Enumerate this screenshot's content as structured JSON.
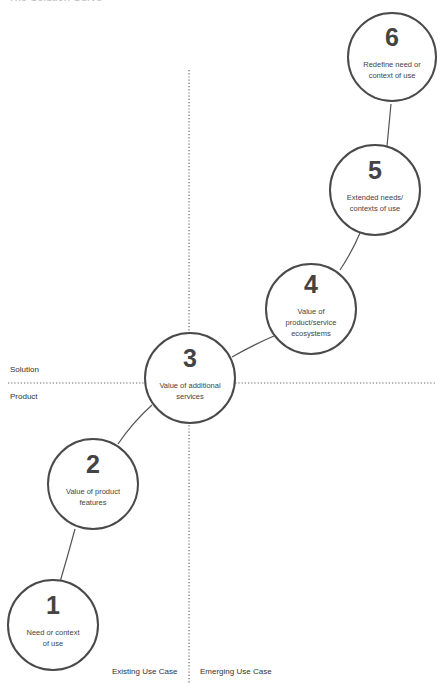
{
  "title": "The Solution Curve",
  "axes": {
    "horizontal_upper_label": "Solution",
    "horizontal_lower_label": "Product",
    "vertical_left_label": "Existing Use Case",
    "vertical_right_label": "Emerging Use Case"
  },
  "nodes": [
    {
      "number": "1",
      "label": "Need or context of use"
    },
    {
      "number": "2",
      "label": "Value of product features"
    },
    {
      "number": "3",
      "label": "Value of additional services"
    },
    {
      "number": "4",
      "label": "Value of product/service ecosystems"
    },
    {
      "number": "5",
      "label": "Extended needs/ contexts of use"
    },
    {
      "number": "6",
      "label": "Redefine need or context of use"
    }
  ],
  "colors": {
    "stroke": "#4a4a4a",
    "divider": "#666666",
    "text": "#333333"
  }
}
